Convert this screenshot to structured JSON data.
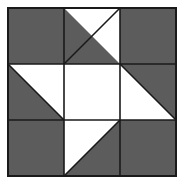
{
  "figure": {
    "canvas_width": 184,
    "canvas_height": 184,
    "background_color": "#ffffff"
  },
  "palette": {
    "fabric_dark": "#5c5c5c",
    "fabric_light": "#ffffff",
    "seam_line": "#1a1a1a",
    "background": "#ffffff"
  },
  "block": {
    "origin_x": 8,
    "origin_y": 8,
    "size": 168,
    "rows": 3,
    "columns": 3,
    "cell_size": 56,
    "seam_width": 1.6,
    "outer_border_width": 2
  },
  "grid_lines": {
    "vertical_x": [
      64,
      120
    ],
    "horizontal_y": [
      64,
      120
    ]
  },
  "patches": [
    {
      "id": "patch-r1c1",
      "name": "top-left-corner",
      "row": 1,
      "column": 1,
      "type": "solid",
      "fill": "dark",
      "x": 8,
      "y": 8,
      "w": 56,
      "h": 56
    },
    {
      "id": "patch-r1c2",
      "name": "top-center-half-square-triangle",
      "row": 1,
      "column": 2,
      "type": "half-square-triangle",
      "diagonal": "bottomleft-topright",
      "fill": "dark",
      "light_corner": "top-right",
      "x": 64,
      "y": 8,
      "w": 56,
      "h": 56,
      "light_points": "64,8 120,8 120,64",
      "dark_points": "64,8 120,64 64,64"
    },
    {
      "id": "patch-r1c3",
      "name": "top-right-corner",
      "row": 1,
      "column": 3,
      "type": "solid",
      "fill": "dark",
      "x": 120,
      "y": 8,
      "w": 56,
      "h": 56
    },
    {
      "id": "patch-r2c1",
      "name": "middle-left-half-square-triangle",
      "row": 2,
      "column": 1,
      "type": "half-square-triangle",
      "diagonal": "topleft-bottomright",
      "fill": "dark",
      "light_corner": "top-right",
      "x": 8,
      "y": 64,
      "w": 56,
      "h": 56,
      "light_points": "8,64 64,64 64,120",
      "dark_points": "8,64 64,120 8,120"
    },
    {
      "id": "patch-r2c2",
      "name": "center-square",
      "row": 2,
      "column": 2,
      "type": "solid",
      "fill": "light",
      "x": 64,
      "y": 64,
      "w": 56,
      "h": 56
    },
    {
      "id": "patch-r2c3",
      "name": "middle-right-half-square-triangle",
      "row": 2,
      "column": 3,
      "type": "half-square-triangle",
      "diagonal": "topleft-bottomright",
      "fill": "dark",
      "light_corner": "bottom-left",
      "x": 120,
      "y": 64,
      "w": 56,
      "h": 56,
      "light_points": "120,64 176,120 120,120",
      "dark_points": "120,64 176,64 176,120"
    },
    {
      "id": "patch-r3c1",
      "name": "bottom-left-corner",
      "row": 3,
      "column": 1,
      "type": "solid",
      "fill": "dark",
      "x": 8,
      "y": 120,
      "w": 56,
      "h": 56
    },
    {
      "id": "patch-r3c2",
      "name": "bottom-center-half-square-triangle",
      "row": 3,
      "column": 2,
      "type": "half-square-triangle",
      "diagonal": "bottomleft-topright",
      "fill": "dark",
      "light_corner": "top-left",
      "x": 64,
      "y": 120,
      "w": 56,
      "h": 56,
      "light_points": "64,120 120,120 64,176",
      "dark_points": "120,120 120,176 64,176"
    },
    {
      "id": "patch-r3c3",
      "name": "bottom-right-corner",
      "row": 3,
      "column": 3,
      "type": "solid",
      "fill": "dark",
      "x": 120,
      "y": 120,
      "w": 56,
      "h": 56
    }
  ]
}
